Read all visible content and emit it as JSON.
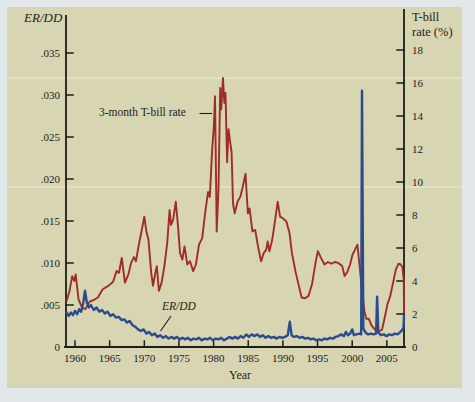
{
  "colors": {
    "page_bg": "#e2e7ea",
    "panel_bg": "#d8d5b2",
    "axis": "#1e1d1a",
    "tbill_line": "#a02c26",
    "erdd_line": "#2b4b8e"
  },
  "chart_data": {
    "type": "line",
    "title": "",
    "x_axis": {
      "title": "Year",
      "range": [
        1958.7,
        2007.6
      ],
      "ticks": [
        {
          "value": 1960,
          "label": "1960"
        },
        {
          "value": 1965,
          "label": "1965"
        },
        {
          "value": 1970,
          "label": "1970"
        },
        {
          "value": 1975,
          "label": "1975"
        },
        {
          "value": 1980,
          "label": "1980"
        },
        {
          "value": 1985,
          "label": "1985"
        },
        {
          "value": 1990,
          "label": "1990"
        },
        {
          "value": 1995,
          "label": "1995"
        },
        {
          "value": 2000,
          "label": "2000"
        },
        {
          "value": 2005,
          "label": "2005"
        }
      ]
    },
    "left_axis": {
      "title": "ER/DD",
      "range": [
        0,
        0.035
      ],
      "ticks": [
        {
          "value": 0,
          "label": "0"
        },
        {
          "value": 0.005,
          "label": ".005"
        },
        {
          "value": 0.01,
          "label": ".010"
        },
        {
          "value": 0.015,
          "label": ".015"
        },
        {
          "value": 0.02,
          "label": ".020"
        },
        {
          "value": 0.025,
          "label": ".025"
        },
        {
          "value": 0.03,
          "label": ".030"
        },
        {
          "value": 0.035,
          "label": ".035"
        }
      ]
    },
    "right_axis": {
      "title_lines": [
        "T-bill",
        "rate (%)"
      ],
      "range": [
        0,
        18
      ],
      "ticks": [
        {
          "value": 0,
          "label": "0"
        },
        {
          "value": 2,
          "label": "2"
        },
        {
          "value": 4,
          "label": "4"
        },
        {
          "value": 6,
          "label": "6"
        },
        {
          "value": 8,
          "label": "8"
        },
        {
          "value": 10,
          "label": "10"
        },
        {
          "value": 12,
          "label": "12"
        },
        {
          "value": 14,
          "label": "14"
        },
        {
          "value": 16,
          "label": "16"
        },
        {
          "value": 18,
          "label": "18"
        }
      ]
    },
    "annotations": [
      {
        "text": "3-month T-bill rate",
        "points_to": "tbill-series"
      },
      {
        "text": "ER/DD",
        "points_to": "erdd-series"
      }
    ],
    "grid": "off",
    "legend": "inline-annotations",
    "series": [
      {
        "name": "3-month T-bill rate",
        "axis": "right",
        "color": "#a02c26",
        "points": [
          [
            1958.8,
            2.8
          ],
          [
            1959.2,
            3.4
          ],
          [
            1959.6,
            4.3
          ],
          [
            1959.9,
            4.0
          ],
          [
            1960.1,
            4.4
          ],
          [
            1960.5,
            2.9
          ],
          [
            1961.0,
            2.4
          ],
          [
            1961.5,
            2.3
          ],
          [
            1962.1,
            2.75
          ],
          [
            1962.7,
            2.85
          ],
          [
            1963.3,
            3.0
          ],
          [
            1964.0,
            3.5
          ],
          [
            1964.8,
            3.7
          ],
          [
            1965.5,
            3.95
          ],
          [
            1966.0,
            4.6
          ],
          [
            1966.35,
            4.5
          ],
          [
            1966.75,
            5.4
          ],
          [
            1967.2,
            3.9
          ],
          [
            1967.7,
            4.4
          ],
          [
            1968.1,
            5.1
          ],
          [
            1968.5,
            5.45
          ],
          [
            1968.8,
            5.2
          ],
          [
            1969.2,
            6.2
          ],
          [
            1969.6,
            7.0
          ],
          [
            1970.0,
            7.9
          ],
          [
            1970.3,
            7.0
          ],
          [
            1970.6,
            6.5
          ],
          [
            1971.0,
            4.5
          ],
          [
            1971.25,
            3.7
          ],
          [
            1971.55,
            4.4
          ],
          [
            1971.8,
            4.9
          ],
          [
            1972.1,
            3.4
          ],
          [
            1972.5,
            3.9
          ],
          [
            1972.9,
            4.9
          ],
          [
            1973.3,
            6.3
          ],
          [
            1973.65,
            8.3
          ],
          [
            1973.85,
            7.4
          ],
          [
            1974.15,
            7.7
          ],
          [
            1974.55,
            8.8
          ],
          [
            1974.85,
            7.4
          ],
          [
            1975.15,
            5.7
          ],
          [
            1975.5,
            5.3
          ],
          [
            1975.8,
            6.1
          ],
          [
            1976.2,
            5.0
          ],
          [
            1976.6,
            5.2
          ],
          [
            1977.05,
            4.6
          ],
          [
            1977.45,
            5.0
          ],
          [
            1977.9,
            6.2
          ],
          [
            1978.35,
            6.6
          ],
          [
            1978.8,
            8.2
          ],
          [
            1979.2,
            9.4
          ],
          [
            1979.45,
            9.1
          ],
          [
            1979.8,
            12.0
          ],
          [
            1980.05,
            13.4
          ],
          [
            1980.2,
            15.2
          ],
          [
            1980.45,
            7.0
          ],
          [
            1980.7,
            9.6
          ],
          [
            1980.95,
            15.7
          ],
          [
            1981.1,
            14.4
          ],
          [
            1981.35,
            16.3
          ],
          [
            1981.55,
            14.8
          ],
          [
            1981.72,
            15.4
          ],
          [
            1981.95,
            11.2
          ],
          [
            1982.15,
            13.2
          ],
          [
            1982.4,
            12.4
          ],
          [
            1982.6,
            11.8
          ],
          [
            1982.8,
            8.7
          ],
          [
            1983.05,
            8.1
          ],
          [
            1983.45,
            8.8
          ],
          [
            1983.85,
            9.1
          ],
          [
            1984.2,
            9.7
          ],
          [
            1984.6,
            10.5
          ],
          [
            1984.95,
            8.1
          ],
          [
            1985.2,
            8.4
          ],
          [
            1985.6,
            7.0
          ],
          [
            1986.0,
            7.1
          ],
          [
            1986.45,
            6.0
          ],
          [
            1986.85,
            5.2
          ],
          [
            1987.25,
            5.7
          ],
          [
            1987.6,
            5.9
          ],
          [
            1987.8,
            6.4
          ],
          [
            1988.05,
            5.8
          ],
          [
            1988.45,
            6.5
          ],
          [
            1988.85,
            7.6
          ],
          [
            1989.25,
            8.8
          ],
          [
            1989.6,
            7.9
          ],
          [
            1990.0,
            7.8
          ],
          [
            1990.5,
            7.6
          ],
          [
            1990.95,
            6.9
          ],
          [
            1991.3,
            5.7
          ],
          [
            1991.8,
            4.6
          ],
          [
            1992.2,
            3.9
          ],
          [
            1992.7,
            3.0
          ],
          [
            1993.2,
            2.95
          ],
          [
            1993.7,
            3.1
          ],
          [
            1994.2,
            3.8
          ],
          [
            1994.7,
            5.1
          ],
          [
            1995.05,
            5.8
          ],
          [
            1995.5,
            5.4
          ],
          [
            1996.0,
            5.0
          ],
          [
            1996.5,
            5.15
          ],
          [
            1997.0,
            5.05
          ],
          [
            1997.5,
            5.15
          ],
          [
            1998.0,
            5.1
          ],
          [
            1998.55,
            4.9
          ],
          [
            1998.9,
            4.3
          ],
          [
            1999.3,
            4.55
          ],
          [
            1999.7,
            5.0
          ],
          [
            2000.05,
            5.6
          ],
          [
            2000.4,
            5.9
          ],
          [
            2000.75,
            6.2
          ],
          [
            2001.1,
            4.8
          ],
          [
            2001.4,
            3.5
          ],
          [
            2001.75,
            2.2
          ],
          [
            2002.05,
            1.7
          ],
          [
            2002.4,
            1.72
          ],
          [
            2002.8,
            1.3
          ],
          [
            2003.2,
            1.1
          ],
          [
            2003.5,
            0.92
          ],
          [
            2003.9,
            0.95
          ],
          [
            2004.3,
            1.05
          ],
          [
            2004.7,
            1.8
          ],
          [
            2005.1,
            2.6
          ],
          [
            2005.5,
            3.1
          ],
          [
            2005.9,
            3.9
          ],
          [
            2006.3,
            4.7
          ],
          [
            2006.7,
            5.05
          ],
          [
            2007.0,
            5.0
          ],
          [
            2007.25,
            4.85
          ],
          [
            2007.45,
            4.0
          ],
          [
            2007.55,
            2.1
          ]
        ]
      },
      {
        "name": "ER/DD",
        "axis": "left",
        "color": "#2b4b8e",
        "points": [
          [
            1958.8,
            0.0041
          ],
          [
            1959.1,
            0.0037
          ],
          [
            1959.4,
            0.0041
          ],
          [
            1959.7,
            0.0038
          ],
          [
            1960.0,
            0.0043
          ],
          [
            1960.3,
            0.0039
          ],
          [
            1960.6,
            0.0045
          ],
          [
            1960.9,
            0.0042
          ],
          [
            1961.2,
            0.0053
          ],
          [
            1961.45,
            0.0067
          ],
          [
            1961.7,
            0.0053
          ],
          [
            1962.0,
            0.0047
          ],
          [
            1962.3,
            0.005
          ],
          [
            1962.7,
            0.0044
          ],
          [
            1963.1,
            0.0047
          ],
          [
            1963.5,
            0.0042
          ],
          [
            1963.9,
            0.0044
          ],
          [
            1964.3,
            0.004
          ],
          [
            1964.7,
            0.0042
          ],
          [
            1965.1,
            0.0037
          ],
          [
            1965.5,
            0.0039
          ],
          [
            1965.9,
            0.0035
          ],
          [
            1966.3,
            0.0036
          ],
          [
            1966.7,
            0.0032
          ],
          [
            1967.1,
            0.0033
          ],
          [
            1967.5,
            0.0029
          ],
          [
            1967.9,
            0.0031
          ],
          [
            1968.3,
            0.0026
          ],
          [
            1968.7,
            0.0024
          ],
          [
            1969.1,
            0.0021
          ],
          [
            1969.5,
            0.0019
          ],
          [
            1969.9,
            0.0021
          ],
          [
            1970.3,
            0.0016
          ],
          [
            1970.7,
            0.0018
          ],
          [
            1971.1,
            0.0014
          ],
          [
            1971.5,
            0.0016
          ],
          [
            1971.9,
            0.0012
          ],
          [
            1972.3,
            0.0014
          ],
          [
            1972.7,
            0.0011
          ],
          [
            1973.1,
            0.0013
          ],
          [
            1973.5,
            0.001
          ],
          [
            1973.9,
            0.0012
          ],
          [
            1974.3,
            0.001
          ],
          [
            1974.7,
            0.0012
          ],
          [
            1975.1,
            0.0009
          ],
          [
            1975.5,
            0.0011
          ],
          [
            1975.9,
            0.0009
          ],
          [
            1976.3,
            0.0011
          ],
          [
            1976.7,
            0.0008
          ],
          [
            1977.1,
            0.001
          ],
          [
            1977.5,
            0.0009
          ],
          [
            1977.9,
            0.0011
          ],
          [
            1978.3,
            0.0008
          ],
          [
            1978.7,
            0.001
          ],
          [
            1979.1,
            0.0009
          ],
          [
            1979.5,
            0.0011
          ],
          [
            1979.9,
            0.0008
          ],
          [
            1980.3,
            0.001
          ],
          [
            1980.7,
            0.0009
          ],
          [
            1981.1,
            0.0011
          ],
          [
            1981.5,
            0.0008
          ],
          [
            1981.9,
            0.001
          ],
          [
            1982.3,
            0.0012
          ],
          [
            1982.7,
            0.001
          ],
          [
            1983.1,
            0.0012
          ],
          [
            1983.5,
            0.001
          ],
          [
            1983.9,
            0.0013
          ],
          [
            1984.3,
            0.0011
          ],
          [
            1984.7,
            0.0015
          ],
          [
            1985.1,
            0.0012
          ],
          [
            1985.5,
            0.0015
          ],
          [
            1985.9,
            0.0013
          ],
          [
            1986.3,
            0.0015
          ],
          [
            1986.7,
            0.0012
          ],
          [
            1987.1,
            0.0014
          ],
          [
            1987.5,
            0.0011
          ],
          [
            1987.9,
            0.0013
          ],
          [
            1988.3,
            0.0011
          ],
          [
            1988.7,
            0.0012
          ],
          [
            1989.1,
            0.001
          ],
          [
            1989.5,
            0.0012
          ],
          [
            1989.9,
            0.0011
          ],
          [
            1990.3,
            0.0012
          ],
          [
            1990.7,
            0.0014
          ],
          [
            1991.0,
            0.003
          ],
          [
            1991.25,
            0.0014
          ],
          [
            1991.6,
            0.0012
          ],
          [
            1992.0,
            0.0013
          ],
          [
            1992.4,
            0.0011
          ],
          [
            1992.8,
            0.0012
          ],
          [
            1993.2,
            0.001
          ],
          [
            1993.6,
            0.0011
          ],
          [
            1994.0,
            0.0009
          ],
          [
            1994.4,
            0.001
          ],
          [
            1994.8,
            0.0008
          ],
          [
            1995.2,
            0.0009
          ],
          [
            1995.6,
            0.0008
          ],
          [
            1996.0,
            0.001
          ],
          [
            1996.4,
            0.0009
          ],
          [
            1996.8,
            0.0011
          ],
          [
            1997.2,
            0.001
          ],
          [
            1997.6,
            0.0012
          ],
          [
            1998.0,
            0.0013
          ],
          [
            1998.4,
            0.0015
          ],
          [
            1998.8,
            0.0013
          ],
          [
            1999.1,
            0.0018
          ],
          [
            1999.4,
            0.0014
          ],
          [
            1999.7,
            0.0016
          ],
          [
            2000.0,
            0.0021
          ],
          [
            2000.25,
            0.0014
          ],
          [
            2000.6,
            0.0015
          ],
          [
            2001.0,
            0.0016
          ],
          [
            2001.3,
            0.0015
          ],
          [
            2001.42,
            0.0305
          ],
          [
            2001.6,
            0.0022
          ],
          [
            2001.95,
            0.0017
          ],
          [
            2002.3,
            0.0015
          ],
          [
            2002.7,
            0.0016
          ],
          [
            2003.1,
            0.0015
          ],
          [
            2003.45,
            0.0016
          ],
          [
            2003.6,
            0.006
          ],
          [
            2003.78,
            0.0017
          ],
          [
            2004.15,
            0.0014
          ],
          [
            2004.55,
            0.0015
          ],
          [
            2004.95,
            0.0013
          ],
          [
            2005.35,
            0.0015
          ],
          [
            2005.75,
            0.0014
          ],
          [
            2006.15,
            0.0016
          ],
          [
            2006.55,
            0.0015
          ],
          [
            2006.95,
            0.0018
          ],
          [
            2007.2,
            0.002
          ],
          [
            2007.4,
            0.0023
          ],
          [
            2007.55,
            0.0038
          ]
        ]
      }
    ]
  }
}
